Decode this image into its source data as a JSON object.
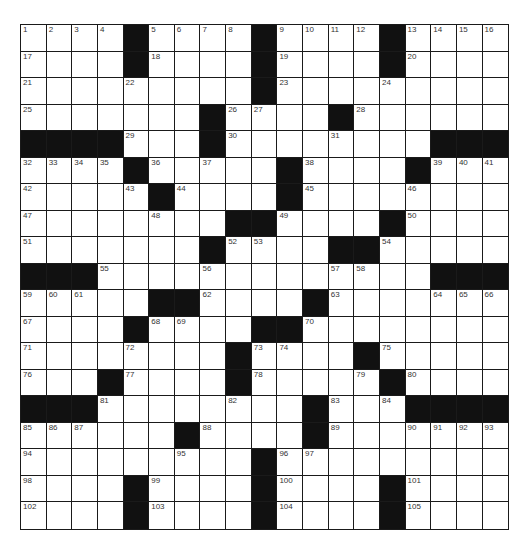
{
  "puzzle": {
    "rows": 19,
    "cols": 19,
    "colors": {
      "black_cell": "#111111",
      "white_cell": "#ffffff",
      "grid_line": "#1a1a1a",
      "number_text": "#333333"
    },
    "grid": [
      [
        1,
        2,
        3,
        4,
        "#",
        5,
        6,
        7,
        8,
        "#",
        9,
        10,
        11,
        12,
        "#",
        13,
        14,
        15,
        16
      ],
      [
        17,
        0,
        0,
        0,
        "#",
        18,
        0,
        0,
        0,
        "#",
        19,
        0,
        0,
        0,
        "#",
        20,
        0,
        0,
        0
      ],
      [
        21,
        0,
        0,
        0,
        22,
        0,
        0,
        0,
        0,
        "#",
        23,
        0,
        0,
        0,
        24,
        0,
        0,
        0,
        0
      ],
      [
        25,
        0,
        0,
        0,
        0,
        0,
        0,
        "#",
        26,
        27,
        0,
        0,
        "#",
        28,
        0,
        0,
        0,
        0,
        0
      ],
      [
        "#",
        "#",
        "#",
        "#",
        29,
        0,
        0,
        "#",
        30,
        0,
        0,
        0,
        31,
        0,
        0,
        0,
        "#",
        "#",
        "#"
      ],
      [
        32,
        33,
        34,
        35,
        "#",
        36,
        0,
        37,
        0,
        0,
        "#",
        38,
        0,
        0,
        0,
        "#",
        39,
        40,
        41
      ],
      [
        42,
        0,
        0,
        0,
        43,
        "#",
        44,
        0,
        0,
        0,
        "#",
        45,
        0,
        0,
        0,
        46,
        0,
        0,
        0
      ],
      [
        47,
        0,
        0,
        0,
        0,
        48,
        0,
        0,
        "#",
        "#",
        49,
        0,
        0,
        0,
        "#",
        50,
        0,
        0,
        0
      ],
      [
        51,
        0,
        0,
        0,
        0,
        0,
        0,
        "#",
        52,
        53,
        0,
        0,
        "#",
        "#",
        54,
        0,
        0,
        0,
        0
      ],
      [
        "#",
        "#",
        "#",
        55,
        0,
        0,
        0,
        56,
        0,
        0,
        0,
        0,
        57,
        58,
        0,
        0,
        "#",
        "#",
        "#"
      ],
      [
        59,
        60,
        61,
        0,
        0,
        "#",
        "#",
        62,
        0,
        0,
        0,
        "#",
        63,
        0,
        0,
        0,
        64,
        65,
        66
      ],
      [
        67,
        0,
        0,
        0,
        "#",
        68,
        69,
        0,
        0,
        "#",
        "#",
        70,
        0,
        0,
        0,
        0,
        0,
        0,
        0
      ],
      [
        71,
        0,
        0,
        0,
        72,
        0,
        0,
        0,
        "#",
        73,
        74,
        0,
        0,
        "#",
        75,
        0,
        0,
        0,
        0
      ],
      [
        76,
        0,
        0,
        "#",
        77,
        0,
        0,
        0,
        "#",
        78,
        0,
        0,
        0,
        79,
        "#",
        80,
        0,
        0,
        0
      ],
      [
        "#",
        "#",
        "#",
        81,
        0,
        0,
        0,
        0,
        82,
        0,
        0,
        "#",
        83,
        0,
        84,
        "#",
        "#",
        "#",
        "#"
      ],
      [
        85,
        86,
        87,
        0,
        0,
        0,
        "#",
        88,
        0,
        0,
        0,
        "#",
        89,
        0,
        0,
        90,
        91,
        92,
        93
      ],
      [
        94,
        0,
        0,
        0,
        0,
        0,
        95,
        0,
        0,
        "#",
        96,
        97,
        0,
        0,
        0,
        0,
        0,
        0,
        0
      ],
      [
        98,
        0,
        0,
        0,
        "#",
        99,
        0,
        0,
        0,
        "#",
        100,
        0,
        0,
        0,
        "#",
        101,
        0,
        0,
        0
      ],
      [
        102,
        0,
        0,
        0,
        "#",
        103,
        0,
        0,
        0,
        "#",
        104,
        0,
        0,
        0,
        "#",
        105,
        0,
        0,
        0
      ]
    ],
    "letters": {}
  }
}
